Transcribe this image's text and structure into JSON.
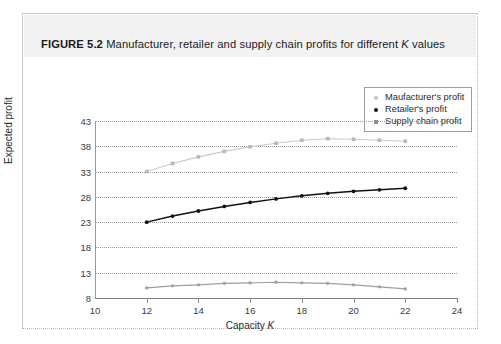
{
  "figure": {
    "label": "FIGURE 5.2",
    "caption_before_k": "Manufacturer, retailer and supply chain profits for different ",
    "caption_k": "K",
    "caption_after_k": " values"
  },
  "legend": {
    "items": [
      {
        "label": "Maufacturer's profit",
        "marker": "dot",
        "color": "#c3c3c3"
      },
      {
        "label": "Retailer's profit",
        "marker": "dot",
        "color": "#111111"
      },
      {
        "label": "Supply chain profit",
        "marker": "square",
        "color": "#8d8d8d"
      }
    ]
  },
  "chart_data": {
    "type": "line",
    "title": "Manufacturer, retailer and supply chain profits for different K values",
    "xlabel": "Capacity K",
    "ylabel": "Expected profit",
    "xlim": [
      10,
      24
    ],
    "ylim": [
      8,
      43
    ],
    "xticks": [
      10,
      12,
      14,
      16,
      18,
      20,
      22,
      24
    ],
    "yticks": [
      8,
      13,
      18,
      23,
      28,
      33,
      38,
      43
    ],
    "grid": true,
    "legend_position": "top-right",
    "x": [
      12,
      13,
      14,
      15,
      16,
      17,
      18,
      19,
      20,
      21,
      22
    ],
    "series": [
      {
        "name": "Supply chain profit",
        "color": "#c9c9c9",
        "marker": "square",
        "values": [
          33.0,
          34.6,
          35.9,
          37.0,
          37.9,
          38.6,
          39.2,
          39.5,
          39.4,
          39.2,
          39.0
        ]
      },
      {
        "name": "Retailer's profit",
        "color": "#111111",
        "marker": "dot",
        "values": [
          23.0,
          24.2,
          25.2,
          26.1,
          26.9,
          27.6,
          28.2,
          28.7,
          29.1,
          29.4,
          29.7
        ]
      },
      {
        "name": "Maufacturer's profit",
        "color": "#9e9e9e",
        "marker": "dot",
        "values": [
          10.0,
          10.4,
          10.6,
          10.9,
          11.0,
          11.1,
          11.0,
          10.9,
          10.6,
          10.2,
          9.8
        ]
      }
    ]
  }
}
